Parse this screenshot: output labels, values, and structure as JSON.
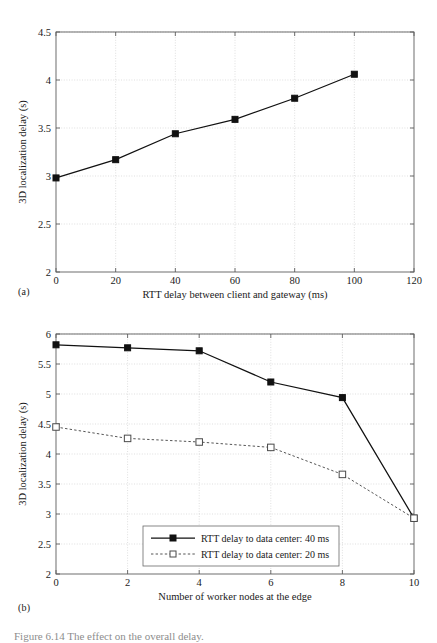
{
  "figure": {
    "caption": "Figure 6.14  The effect on the overall delay.",
    "panel_a_tag": "(a)",
    "panel_b_tag": "(b)"
  },
  "chart_data": [
    {
      "id": "panel-a",
      "type": "line",
      "title": "",
      "xlabel": "RTT delay between client and gateway (ms)",
      "ylabel": "3D localization delay (s)",
      "xlim": [
        0,
        120
      ],
      "ylim": [
        2,
        4.5
      ],
      "xticks": [
        0,
        20,
        40,
        60,
        80,
        100,
        120
      ],
      "xtick_labels": [
        "0",
        "20",
        "40",
        "60",
        "80",
        "100",
        "120"
      ],
      "yticks": [
        2,
        2.5,
        3,
        3.5,
        4,
        4.5
      ],
      "ytick_labels": [
        "2",
        "2.5",
        "3",
        "3.5",
        "4",
        "4.5"
      ],
      "grid": true,
      "legend": null,
      "series": [
        {
          "name": "3D localization delay",
          "marker": "filled-square",
          "style": "solid",
          "x": [
            0,
            20,
            40,
            60,
            80,
            100
          ],
          "values": [
            2.98,
            3.17,
            3.44,
            3.59,
            3.81,
            4.06
          ]
        }
      ]
    },
    {
      "id": "panel-b",
      "type": "line",
      "title": "",
      "xlabel": "Number of worker nodes at the edge",
      "ylabel": "3D localization delay (s)",
      "xlim": [
        0,
        10
      ],
      "ylim": [
        2,
        6
      ],
      "xticks": [
        0,
        2,
        4,
        6,
        8,
        10
      ],
      "xtick_labels": [
        "0",
        "2",
        "4",
        "6",
        "8",
        "10"
      ],
      "yticks": [
        2,
        2.5,
        3,
        3.5,
        4,
        4.5,
        5,
        5.5,
        6
      ],
      "ytick_labels": [
        "2",
        "2.5",
        "3",
        "3.5",
        "4",
        "4.5",
        "5",
        "5.5",
        "6"
      ],
      "grid": true,
      "legend": {
        "position": "lower-center-inside",
        "entries": [
          "RTT delay to data center: 40 ms",
          "RTT delay to data center: 20 ms"
        ]
      },
      "x": [
        0,
        2,
        4,
        6,
        8,
        10
      ],
      "series": [
        {
          "name": "RTT delay to data center: 40 ms",
          "marker": "filled-square",
          "style": "solid",
          "values": [
            5.82,
            5.77,
            5.72,
            5.2,
            4.94,
            2.93
          ]
        },
        {
          "name": "RTT delay to data center: 20 ms",
          "marker": "open-square",
          "style": "dashed",
          "values": [
            4.45,
            4.26,
            4.2,
            4.11,
            3.66,
            2.93
          ]
        }
      ]
    }
  ]
}
